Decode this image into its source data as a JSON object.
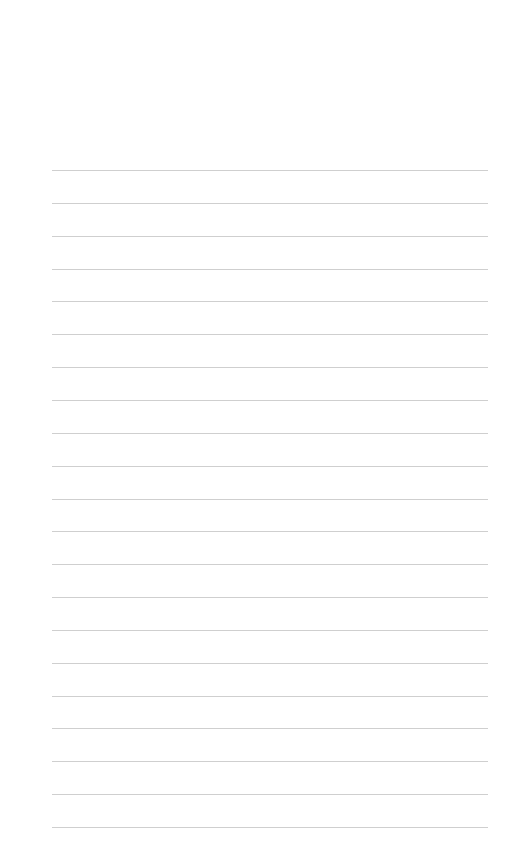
{
  "page": {
    "type": "lined-paper",
    "background_color": "#ffffff",
    "line_color": "#cfcfcf",
    "line_count": 21,
    "first_line_y": 170,
    "line_spacing": 32.85,
    "line_left": 52,
    "line_width": 436
  }
}
